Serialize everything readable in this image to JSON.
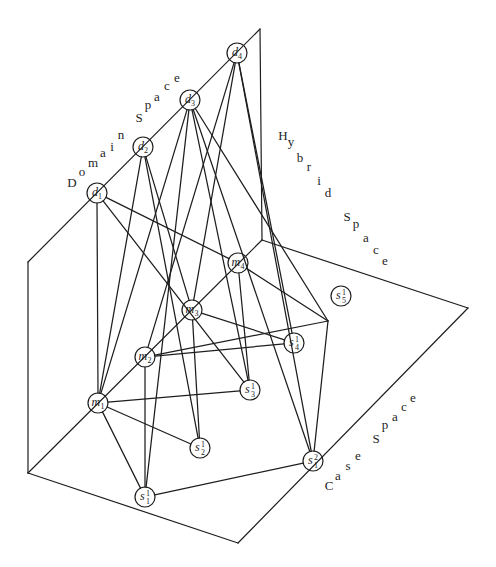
{
  "labels": {
    "domain_space": "Domain Space",
    "hybrid_space": "Hybrid Space",
    "case_space": "Case Space"
  },
  "nodes": [
    {
      "id": "d1",
      "space": "domain",
      "symbol": "d",
      "subscript": "1",
      "superscript": ""
    },
    {
      "id": "d2",
      "space": "domain",
      "symbol": "d",
      "subscript": "2",
      "superscript": ""
    },
    {
      "id": "d3",
      "space": "domain",
      "symbol": "d",
      "subscript": "3",
      "superscript": ""
    },
    {
      "id": "d4",
      "space": "domain",
      "symbol": "d",
      "subscript": "4",
      "superscript": ""
    },
    {
      "id": "m1",
      "space": "hybrid",
      "symbol": "m",
      "subscript": "1",
      "superscript": ""
    },
    {
      "id": "m2",
      "space": "hybrid",
      "symbol": "m",
      "subscript": "2",
      "superscript": ""
    },
    {
      "id": "m3",
      "space": "hybrid",
      "symbol": "m",
      "subscript": "3",
      "superscript": ""
    },
    {
      "id": "m4",
      "space": "hybrid",
      "symbol": "m",
      "subscript": "4",
      "superscript": ""
    },
    {
      "id": "s1",
      "space": "case",
      "symbol": "s",
      "subscript": "1",
      "superscript": "1"
    },
    {
      "id": "s2",
      "space": "case",
      "symbol": "s",
      "subscript": "2",
      "superscript": "1"
    },
    {
      "id": "s3",
      "space": "case",
      "symbol": "s",
      "subscript": "3",
      "superscript": "1"
    },
    {
      "id": "s4",
      "space": "case",
      "symbol": "s",
      "subscript": "4",
      "superscript": "1"
    },
    {
      "id": "s5",
      "space": "case",
      "symbol": "s",
      "subscript": "5",
      "superscript": "1"
    },
    {
      "id": "s1b",
      "space": "case",
      "symbol": "s",
      "subscript": "1",
      "superscript": "2"
    },
    {
      "id": "j",
      "space": "case",
      "symbol": "",
      "subscript": "",
      "superscript": ""
    }
  ],
  "edges": [
    [
      "d1",
      "m1"
    ],
    [
      "d1",
      "m4"
    ],
    [
      "d1",
      "s3"
    ],
    [
      "d2",
      "m1"
    ],
    [
      "d2",
      "m3"
    ],
    [
      "d2",
      "s2"
    ],
    [
      "d3",
      "m1"
    ],
    [
      "d3",
      "s1"
    ],
    [
      "d3",
      "s3"
    ],
    [
      "d3",
      "j"
    ],
    [
      "d3",
      "s1b"
    ],
    [
      "d4",
      "m2"
    ],
    [
      "d4",
      "m3"
    ],
    [
      "d4",
      "s4"
    ],
    [
      "d4",
      "s1b"
    ],
    [
      "m1",
      "s1"
    ],
    [
      "m1",
      "s2"
    ],
    [
      "m1",
      "s3"
    ],
    [
      "m2",
      "s1"
    ],
    [
      "m2",
      "s4"
    ],
    [
      "m2",
      "j"
    ],
    [
      "m3",
      "s2"
    ],
    [
      "m3",
      "s4"
    ],
    [
      "m4",
      "s3"
    ],
    [
      "m4",
      "j"
    ],
    [
      "s1",
      "s1b"
    ],
    [
      "j",
      "s1b"
    ]
  ]
}
